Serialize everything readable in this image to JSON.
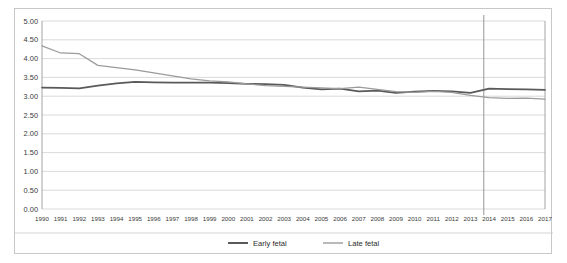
{
  "chart_data": {
    "type": "line",
    "title": "",
    "xlabel": "",
    "ylabel": "",
    "ylim": [
      0.0,
      5.0
    ],
    "ytick_step": 0.5,
    "grid": true,
    "legend_position": "bottom",
    "yticks": [
      "0.00",
      "0.50",
      "1.00",
      "1.50",
      "2.00",
      "2.50",
      "3.00",
      "3.50",
      "4.00",
      "4.50",
      "5.00"
    ],
    "categories": [
      1990,
      1991,
      1992,
      1993,
      1994,
      1995,
      1996,
      1997,
      1998,
      1999,
      2000,
      2001,
      2002,
      2003,
      2004,
      2005,
      2006,
      2007,
      2008,
      2009,
      2010,
      2011,
      2012,
      2013,
      2014,
      2015,
      2016,
      2017
    ],
    "x": [
      "1990",
      "1991",
      "1992",
      "1993",
      "1994",
      "1995",
      "1996",
      "1997",
      "1998",
      "1999",
      "2000",
      "2001",
      "2002",
      "2003",
      "2004",
      "2005",
      "2006",
      "2007",
      "2008",
      "2009",
      "2010",
      "2011",
      "2012",
      "2013",
      "2014",
      "2015",
      "2016",
      "2017"
    ],
    "series": [
      {
        "name": "Early fetal",
        "color": "#58595b",
        "width": 1.7,
        "values": [
          3.23,
          3.22,
          3.21,
          3.28,
          3.34,
          3.38,
          3.37,
          3.36,
          3.36,
          3.36,
          3.35,
          3.33,
          3.32,
          3.3,
          3.23,
          3.18,
          3.2,
          3.13,
          3.15,
          3.09,
          3.12,
          3.14,
          3.13,
          3.09,
          3.2,
          3.19,
          3.18,
          3.17
        ]
      },
      {
        "name": "Late fetal",
        "color": "#9b9b9b",
        "width": 1.25,
        "values": [
          4.34,
          4.15,
          4.13,
          3.82,
          3.76,
          3.7,
          3.62,
          3.54,
          3.46,
          3.41,
          3.38,
          3.33,
          3.28,
          3.26,
          3.24,
          3.22,
          3.2,
          3.24,
          3.18,
          3.12,
          3.1,
          3.13,
          3.1,
          3.02,
          2.96,
          2.94,
          2.95,
          2.92
        ]
      }
    ],
    "annotations": [
      {
        "name": "period-divider",
        "type": "vline",
        "x_position": "between 2013 and 2014",
        "color": "#8a8a8a"
      }
    ]
  },
  "legend": {
    "items": [
      {
        "label": "Early fetal",
        "color": "#58595b"
      },
      {
        "label": "Late fetal",
        "color": "#9b9b9b"
      }
    ]
  }
}
